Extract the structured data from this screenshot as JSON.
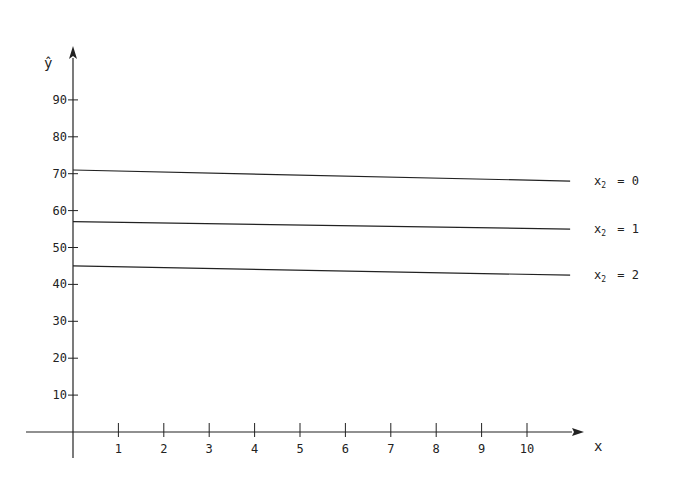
{
  "chart_data": {
    "type": "line",
    "title": "",
    "xlabel": "x",
    "ylabel": "ŷ",
    "xlim": [
      0,
      11
    ],
    "ylim": [
      0,
      100
    ],
    "x_ticks": [
      1,
      2,
      3,
      4,
      5,
      6,
      7,
      8,
      9,
      10
    ],
    "y_ticks": [
      10,
      20,
      30,
      40,
      50,
      60,
      70,
      80,
      90
    ],
    "grid": false,
    "legend_position": "right, inline at line ends",
    "series": [
      {
        "name": "x₂ = 0",
        "label_var": "x",
        "label_sub": "2",
        "label_val": "= 0",
        "x": [
          0,
          10.95
        ],
        "values": [
          71,
          68
        ]
      },
      {
        "name": "x₂ = 1",
        "label_var": "x",
        "label_sub": "2",
        "label_val": "= 1",
        "x": [
          0,
          10.95
        ],
        "values": [
          57,
          55
        ]
      },
      {
        "name": "x₂ = 2",
        "label_var": "x",
        "label_sub": "2",
        "label_val": "= 2",
        "x": [
          0,
          10.95
        ],
        "values": [
          45,
          42.5
        ]
      }
    ],
    "colors": {
      "ink": "#222222",
      "background": "#ffffff"
    }
  }
}
